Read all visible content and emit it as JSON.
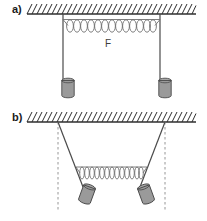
{
  "figure": {
    "panels": [
      {
        "id": "a",
        "label": "a)",
        "state": "relaxed",
        "ceiling": {
          "y": 14,
          "x1": 27,
          "x2": 196,
          "hatch_count": 34,
          "icon": "hatched-ceiling-icon"
        },
        "strings": [
          {
            "name": "left",
            "x_top": 63,
            "y_top": 14,
            "x_bot": 63,
            "y_bot": 80,
            "style": "solid"
          },
          {
            "name": "right",
            "x_top": 160,
            "y_top": 14,
            "x_bot": 160,
            "y_bot": 80,
            "style": "solid"
          }
        ],
        "spring": {
          "x1": 63,
          "x2": 160,
          "y": 25,
          "coils": 13,
          "orientation": "horizontal",
          "state": "stretched"
        },
        "force_label": "F",
        "masses": [
          {
            "name": "left-mass",
            "cx": 68,
            "cy": 88
          },
          {
            "name": "right-mass",
            "cx": 165,
            "cy": 88
          }
        ]
      },
      {
        "id": "b",
        "label": "b)",
        "state": "deflected",
        "ceiling": {
          "y": 122,
          "x1": 27,
          "x2": 196,
          "hatch_count": 34,
          "icon": "hatched-ceiling-icon"
        },
        "strings": [
          {
            "name": "left",
            "x_top": 58,
            "y_top": 122,
            "x_bot": 82,
            "y_bot": 186,
            "style": "solid"
          },
          {
            "name": "right",
            "x_top": 165,
            "y_top": 122,
            "x_bot": 141,
            "y_bot": 186,
            "style": "solid"
          }
        ],
        "reference_lines": [
          {
            "name": "left-dashed",
            "x": 58,
            "y1": 122,
            "y2": 212,
            "style": "dashed"
          },
          {
            "name": "right-dashed",
            "x": 165,
            "y1": 122,
            "y2": 212,
            "style": "dashed"
          }
        ],
        "spring": {
          "x1": 82,
          "x2": 141,
          "y": 172,
          "coils": 13,
          "orientation": "horizontal",
          "state": "compressed"
        },
        "masses": [
          {
            "name": "left-mass",
            "cx": 87,
            "cy": 194
          },
          {
            "name": "right-mass",
            "cx": 146,
            "cy": 194
          }
        ]
      }
    ],
    "caption": "",
    "colors": {
      "line": "#4a4a4a",
      "ceiling": "#2e2e2e",
      "spring": "#707070",
      "mass_fill": "#9a9a9a",
      "mass_stroke": "#4a4a4a",
      "dashed": "#8a8a8a",
      "background": "#ffffff",
      "text": "#1a1a1a"
    }
  }
}
